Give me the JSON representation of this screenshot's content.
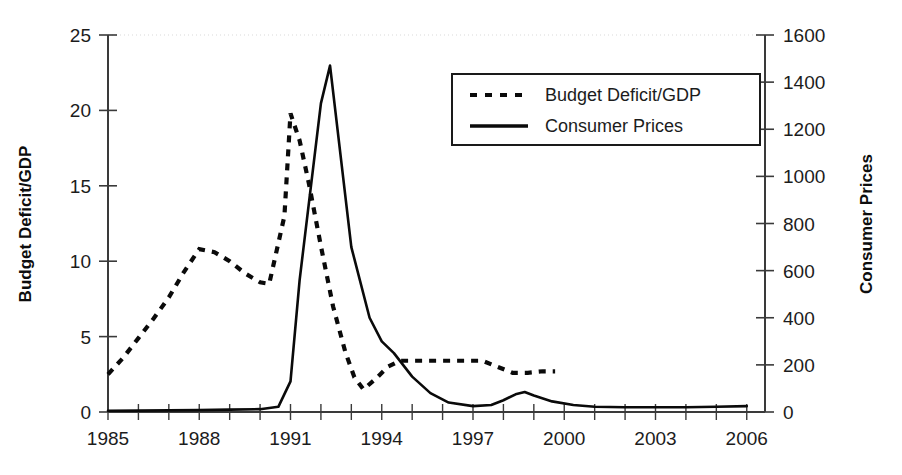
{
  "chart_data": {
    "type": "line",
    "title": "",
    "xlabel": "",
    "ylabel": "Budget Deficit/GDP",
    "y2label": "Consumer Prices",
    "xlim": [
      1985,
      2006.6
    ],
    "ylim": [
      0,
      25
    ],
    "y2lim": [
      0,
      1600
    ],
    "grid": false,
    "legend_position": "top-right",
    "xticks": [
      1985,
      1988,
      1991,
      1994,
      1997,
      2000,
      2003,
      2006
    ],
    "xtick_labels": [
      "1985",
      "1988",
      "1991",
      "1994",
      "1997",
      "2000",
      "2003",
      "2006"
    ],
    "xticks_minor_every": 1,
    "yticks": [
      0,
      5,
      10,
      15,
      20,
      25
    ],
    "ytick_labels": [
      "0",
      "5",
      "10",
      "15",
      "20",
      "25"
    ],
    "y2ticks": [
      0,
      200,
      400,
      600,
      800,
      1000,
      1200,
      1400,
      1600
    ],
    "y2tick_labels": [
      "0",
      "200",
      "400",
      "600",
      "800",
      "1000",
      "1200",
      "1400",
      "1600"
    ],
    "series": [
      {
        "name": "Budget Deficit/GDP",
        "axis": "left",
        "style": "dashed",
        "x": [
          1985.0,
          1985.5,
          1986.0,
          1986.5,
          1987.0,
          1987.5,
          1988.0,
          1988.5,
          1989.0,
          1989.5,
          1990.0,
          1990.3,
          1990.8,
          1991.0,
          1991.3,
          1991.6,
          1992.0,
          1992.4,
          1992.8,
          1993.1,
          1993.4,
          1993.8,
          1994.2,
          1994.6,
          1995.0,
          1995.6,
          1996.2,
          1996.8,
          1997.3,
          1997.8,
          1998.3,
          1998.8,
          1999.3,
          1999.7
        ],
        "y": [
          2.5,
          3.6,
          4.9,
          6.2,
          7.6,
          9.3,
          10.8,
          10.6,
          10.0,
          9.2,
          8.6,
          8.5,
          13.0,
          19.8,
          18.0,
          15.2,
          11.0,
          7.0,
          4.0,
          2.3,
          1.5,
          2.2,
          3.0,
          3.4,
          3.4,
          3.4,
          3.4,
          3.4,
          3.4,
          3.0,
          2.6,
          2.6,
          2.7,
          2.7
        ]
      },
      {
        "name": "Consumer Prices",
        "axis": "right",
        "style": "solid",
        "x": [
          1985.0,
          1986.0,
          1987.0,
          1988.0,
          1989.0,
          1990.0,
          1990.6,
          1991.0,
          1991.3,
          1992.0,
          1992.3,
          1993.0,
          1993.6,
          1994.0,
          1994.4,
          1995.0,
          1995.6,
          1996.2,
          1997.0,
          1997.6,
          1998.0,
          1998.4,
          1998.7,
          1999.0,
          1999.6,
          2000.3,
          2001.0,
          2002.0,
          2003.0,
          2004.0,
          2005.0,
          2006.0
        ],
        "y": [
          5,
          6,
          7,
          8,
          10,
          12,
          22,
          130,
          560,
          1310,
          1470,
          700,
          400,
          300,
          250,
          150,
          80,
          40,
          25,
          30,
          50,
          75,
          85,
          70,
          45,
          30,
          22,
          20,
          20,
          20,
          22,
          25
        ]
      }
    ],
    "annotations": []
  },
  "legend": {
    "items": [
      {
        "label": "Budget Deficit/GDP",
        "style": "dashed"
      },
      {
        "label": "Consumer Prices",
        "style": "solid"
      }
    ]
  },
  "axes": {
    "left_title": "Budget Deficit/GDP",
    "right_title": "Consumer Prices"
  },
  "colors": {
    "line": "#0a0a0a",
    "axis": "#3a3a3a",
    "text": "#1c1c1c",
    "background": "#ffffff"
  }
}
